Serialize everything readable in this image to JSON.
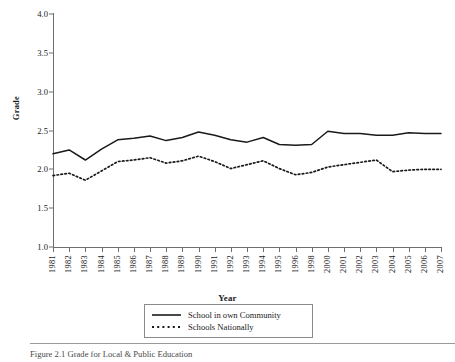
{
  "figure": {
    "footer_caption": "Figure 2.1  Grade for Local & Public Education"
  },
  "legend": {
    "position": "below-axis-center",
    "items": [
      {
        "label": "School in own Community",
        "style": "solid",
        "icon": "solid-line-icon"
      },
      {
        "label": "Schools Nationally",
        "style": "dotted",
        "icon": "dotted-line-icon"
      }
    ]
  },
  "chart_data": {
    "type": "line",
    "title": "",
    "xlabel": "Year",
    "ylabel": "Grade",
    "ylim": [
      1.0,
      4.0
    ],
    "yticks": [
      "1.0",
      "1.5",
      "2.0",
      "2.5",
      "3.0",
      "3.5",
      "4.0"
    ],
    "ytick_values": [
      1.0,
      1.5,
      2.0,
      2.5,
      3.0,
      3.5,
      4.0
    ],
    "grid": false,
    "legend_position": "below",
    "categories": [
      "1981",
      "1982",
      "1983",
      "1984",
      "1985",
      "1986",
      "1987",
      "1988",
      "1989",
      "1990",
      "1991",
      "1992",
      "1993",
      "1994",
      "1995",
      "1996",
      "1998",
      "2000",
      "2001",
      "2002",
      "2003",
      "2004",
      "2005",
      "2006",
      "2007"
    ],
    "series": [
      {
        "name": "School in own Community",
        "style": "solid",
        "color": "#1a1a1a",
        "values": [
          2.2,
          2.25,
          2.12,
          2.26,
          2.38,
          2.4,
          2.43,
          2.37,
          2.41,
          2.48,
          2.44,
          2.38,
          2.35,
          2.41,
          2.32,
          2.31,
          2.32,
          2.49,
          2.46,
          2.46,
          2.44,
          2.44,
          2.47,
          2.46,
          2.46
        ]
      },
      {
        "name": "Schools Nationally",
        "style": "dotted",
        "color": "#1a1a1a",
        "values": [
          1.92,
          1.95,
          1.86,
          1.98,
          2.1,
          2.12,
          2.15,
          2.08,
          2.11,
          2.17,
          2.1,
          2.01,
          2.06,
          2.11,
          2.01,
          1.93,
          1.96,
          2.03,
          2.06,
          2.09,
          2.12,
          1.97,
          1.99,
          2.0,
          2.0
        ]
      }
    ]
  }
}
